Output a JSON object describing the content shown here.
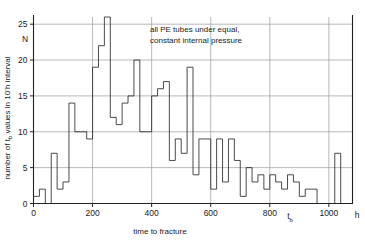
{
  "chart_data": {
    "type": "bar",
    "title": "",
    "annotation": "all PE tubes under equal, constant internal pressure",
    "annotation_line1": "all PE tubes under equal,",
    "annotation_line2": "constant internal pressure",
    "xlabel": "time to fracture",
    "xlabel_symbol": "t",
    "xlabel_symbol_sub": "b",
    "xunit": "h",
    "ylabel_prefix": "number of t",
    "ylabel_sub": "b",
    "ylabel_mid": " values in 10",
    "ylabel_sup": "-",
    "ylabel_suffix": "h interval",
    "ylabel_full": "number of t_b values in 10-h interval",
    "ylabel_axis_symbol": "N",
    "xlim": [
      0,
      1080
    ],
    "ylim": [
      0,
      26
    ],
    "bin_width": 20,
    "xticks": [
      0,
      200,
      400,
      600,
      800,
      1000
    ],
    "xtick_labels": [
      "0",
      "200",
      "400",
      "600",
      "800",
      "1000"
    ],
    "yticks": [
      0,
      5,
      10,
      15,
      20,
      25
    ],
    "ytick_labels": [
      "0",
      "5",
      "10",
      "15",
      "20",
      "25"
    ],
    "grid": true,
    "legend_position": "none",
    "x_bin_starts": [
      0,
      20,
      40,
      60,
      80,
      100,
      120,
      140,
      160,
      180,
      200,
      220,
      240,
      260,
      280,
      300,
      320,
      340,
      360,
      380,
      400,
      420,
      440,
      460,
      480,
      500,
      520,
      540,
      560,
      580,
      600,
      620,
      640,
      660,
      680,
      700,
      720,
      740,
      760,
      780,
      800,
      820,
      840,
      860,
      880,
      900,
      920,
      940,
      960,
      980,
      1000,
      1020,
      1040,
      1060
    ],
    "values": [
      1,
      2,
      0,
      7,
      2,
      3,
      14,
      10,
      10,
      9,
      19,
      22,
      26,
      12,
      11,
      14,
      15,
      20,
      10,
      10,
      15,
      16,
      17,
      6,
      9,
      7,
      19,
      4,
      9,
      9,
      2,
      9,
      3,
      9,
      6,
      1,
      5,
      3,
      4,
      2,
      4,
      3,
      2,
      4,
      3,
      1,
      2,
      2,
      0,
      0,
      0,
      7,
      0,
      0
    ],
    "counts_note": "bin width approximately 20 h",
    "peak_value": 26,
    "peak_bin_start": 240
  },
  "axis": {
    "x_tb_marker": "t",
    "x_tb_marker_sub": "b",
    "x_unit_marker": "h"
  }
}
